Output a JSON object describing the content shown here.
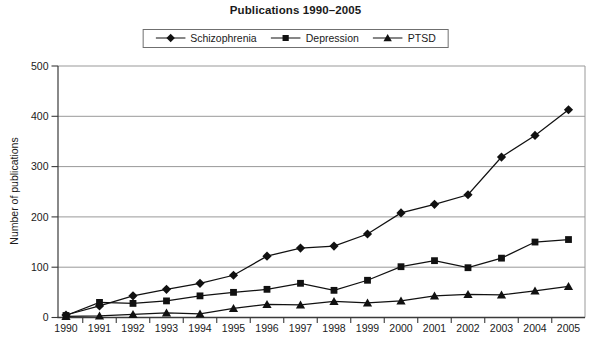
{
  "chart_data": {
    "type": "line",
    "title": "Publications 1990–2005",
    "xlabel": "",
    "ylabel": "Number of publications",
    "categories": [
      "1990",
      "1991",
      "1992",
      "1993",
      "1994",
      "1995",
      "1996",
      "1997",
      "1998",
      "1999",
      "2000",
      "2001",
      "2002",
      "2003",
      "2004",
      "2005"
    ],
    "ylim": [
      0,
      500
    ],
    "yticks": [
      0,
      100,
      200,
      300,
      400,
      500
    ],
    "grid": true,
    "legend_position": "top-center",
    "colors": {
      "series": "#111111",
      "gridline": "#999999",
      "axis": "#3a3a3a",
      "text": "#1a1a1a",
      "background": "#ffffff",
      "legend_border": "#6f6f6f"
    },
    "series": [
      {
        "name": "Schizophrenia",
        "marker": "diamond",
        "values": [
          5,
          23,
          43,
          56,
          68,
          84,
          122,
          138,
          142,
          166,
          208,
          225,
          244,
          319,
          362,
          413
        ]
      },
      {
        "name": "Depression",
        "marker": "square",
        "values": [
          4,
          30,
          28,
          33,
          43,
          50,
          56,
          68,
          54,
          74,
          101,
          113,
          99,
          118,
          150,
          155
        ]
      },
      {
        "name": "PTSD",
        "marker": "triangle",
        "values": [
          2,
          3,
          6,
          9,
          7,
          18,
          26,
          25,
          32,
          29,
          33,
          43,
          46,
          45,
          53,
          62
        ]
      }
    ]
  }
}
